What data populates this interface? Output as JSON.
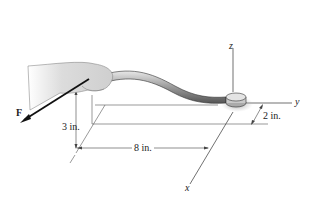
{
  "figure": {
    "axes": {
      "x": "x",
      "y": "y",
      "z": "z"
    },
    "force_label": "F",
    "dimensions": {
      "height": "3 in.",
      "length": "8 in.",
      "offset": "2 in."
    }
  }
}
